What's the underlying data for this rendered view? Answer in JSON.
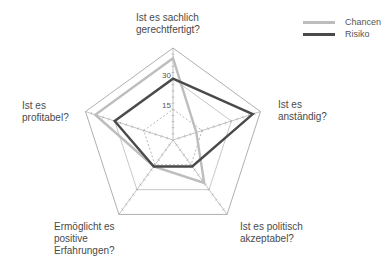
{
  "chart_data": {
    "type": "radar",
    "title": "",
    "axes": [
      "Ist es sachlich gerechtfertigt?",
      "Ist es anständig?",
      "Ist es politisch akzeptabel?",
      "Ermöglicht es positive Erfahrungen?",
      "Ist es profitabel?"
    ],
    "rlim": [
      0,
      45
    ],
    "ticks": [
      15,
      30
    ],
    "series": [
      {
        "name": "Chancen",
        "color": "#bdbdbd",
        "values": [
          40,
          12,
          26,
          16,
          40
        ]
      },
      {
        "name": "Risiko",
        "color": "#4a4a4a",
        "values": [
          30,
          41,
          16,
          16,
          30
        ]
      }
    ],
    "legend_position": "top-right"
  },
  "labels": {
    "axis0": "Ist es sachlich\ngerechtfertigt?",
    "axis1": "Ist es\nanständig?",
    "axis2": "Ist es politisch\nakzeptabel?",
    "axis3": "Ermöglicht es\npositive\nErfahrungen?",
    "axis4": "Ist es\nprofitabel?",
    "tick15": "15",
    "tick30": "30"
  },
  "legend": {
    "items": [
      {
        "label": "Chancen",
        "color": "#bdbdbd"
      },
      {
        "label": "Risiko",
        "color": "#4a4a4a"
      }
    ]
  }
}
